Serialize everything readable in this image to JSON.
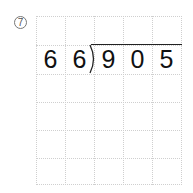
{
  "problem": {
    "number_label": "7"
  },
  "division": {
    "divisor_digits": [
      "6",
      "6"
    ],
    "dividend_digits": [
      "9",
      "0",
      "5"
    ]
  },
  "grid": {
    "columns": 5,
    "rows": 6
  },
  "colors": {
    "grid_line": "#cfcfcf",
    "digit": "#111111",
    "number_circle": "#777777"
  }
}
